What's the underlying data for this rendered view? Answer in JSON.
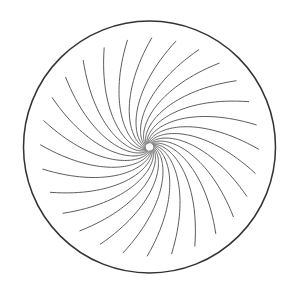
{
  "figure": {
    "canvas": {
      "width": 299,
      "height": 292,
      "background_color": "#ffffff"
    }
  },
  "chart_data": {
    "type": "line",
    "subtitle": "",
    "xlabel": "",
    "ylabel": "",
    "grid": false,
    "legend": false,
    "coordinate_system": "polar",
    "center": {
      "x": 149.5,
      "y": 147.0
    },
    "boundary": {
      "name": "outer-circle",
      "shape": "circle",
      "radius": 126,
      "stroke_color": "#333333",
      "stroke_width": 1.5,
      "fill": "none"
    },
    "hub": {
      "name": "center-hub",
      "shape": "circle",
      "radius": 3.6,
      "fill_color": "#ffffff"
    },
    "arms": {
      "count": 28,
      "angular_step_degrees": 12.857,
      "start_angle_degrees": 0,
      "spiral_type": "logarithmic",
      "winding": "counterclockwise-outward",
      "sweep_degrees": 104,
      "r_start": 4,
      "r_end": 109,
      "stroke_color": "#4a4a4a",
      "stroke_width": 0.9,
      "samples_per_arm": 64
    },
    "series": [
      {
        "name": "spiral-arm",
        "instances": 28,
        "radial_range": [
          4,
          109
        ],
        "angular_sweep_degrees": 104
      }
    ],
    "xlim": [
      -126,
      126
    ],
    "ylim": [
      -126,
      126
    ]
  }
}
